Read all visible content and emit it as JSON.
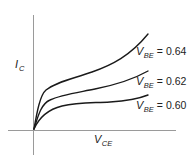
{
  "diagram": {
    "y_axis": {
      "symbol": "I",
      "subscript": "C"
    },
    "x_axis": {
      "symbol": "V",
      "subscript": "CE"
    },
    "curves": [
      {
        "param_symbol": "V",
        "param_subscript": "BE",
        "equals": "=",
        "value": "0.64"
      },
      {
        "param_symbol": "V",
        "param_subscript": "BE",
        "equals": "=",
        "value": "0.62"
      },
      {
        "param_symbol": "V",
        "param_subscript": "BE",
        "equals": "=",
        "value": "0.60"
      }
    ],
    "colors": {
      "axis": "#9a9a9a",
      "curve": "#1a1a1a",
      "text": "#222222"
    }
  }
}
